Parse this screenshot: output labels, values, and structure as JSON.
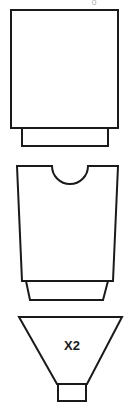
{
  "figure": {
    "name": "stacked-vessel-assembly-diagram",
    "background_color": "#ffffff",
    "line_color": "#1a1a1a",
    "label_color": "#1a1a1a",
    "width": 140,
    "height": 411,
    "top_cut_text": "o"
  },
  "parts": [
    {
      "id": "upper-square-vessel",
      "label": "",
      "body": {
        "shape": "rectangle",
        "x": 11,
        "y": 10,
        "width": 107,
        "height": 118
      },
      "base": {
        "shape": "rectangle",
        "x": 22,
        "y": 128,
        "width": 86,
        "height": 18
      }
    },
    {
      "id": "notched-vessel",
      "label": "",
      "body": {
        "shape": "notched-trapezoid",
        "top_left_x": 17,
        "top_right_x": 118,
        "bottom_left_x": 22,
        "bottom_right_x": 113,
        "top_y": 166,
        "bottom_y": 281,
        "notch": {
          "shape": "semicircle",
          "center_x": 70,
          "left_x": 52,
          "right_x": 88,
          "radius": 18,
          "depth": 18
        }
      },
      "base": {
        "shape": "trapezoid",
        "top_left_x": 26,
        "top_right_x": 108,
        "bottom_left_x": 30,
        "bottom_right_x": 103,
        "top_y": 281,
        "bottom_y": 300
      }
    },
    {
      "id": "funnel-hopper",
      "label": "X2",
      "body": {
        "shape": "inverted-trapezoid",
        "top_left_x": 19,
        "top_right_x": 122,
        "bottom_left_x": 57,
        "bottom_right_x": 87,
        "top_y": 317,
        "bottom_y": 384
      },
      "neck": {
        "shape": "rectangle",
        "x": 58,
        "y": 384,
        "width": 28,
        "height": 17
      },
      "label_position": {
        "x": 72,
        "y": 346
      }
    }
  ]
}
